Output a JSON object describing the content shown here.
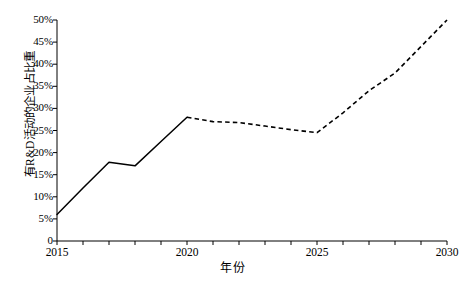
{
  "chart_data": {
    "type": "line",
    "title": "",
    "xlabel": "年份",
    "ylabel": "有R&D活动的企业占比重",
    "xlim": [
      2015,
      2030
    ],
    "ylim": [
      0,
      50
    ],
    "grid": false,
    "legend": "none",
    "x": [
      2015,
      2016,
      2017,
      2018,
      2019,
      2020,
      2021,
      2022,
      2023,
      2024,
      2025,
      2026,
      2027,
      2028,
      2029,
      2030
    ],
    "series": [
      {
        "name": "有R&D活动的企业占比重",
        "style": "solid",
        "segment": "historical",
        "x": [
          2015,
          2016,
          2017,
          2018,
          2019,
          2020
        ],
        "values": [
          6.0,
          12.0,
          17.8,
          17.0,
          22.5,
          28.0
        ]
      },
      {
        "name": "有R&D活动的企业占比重(预测)",
        "style": "dashed",
        "segment": "forecast",
        "x": [
          2020,
          2021,
          2022,
          2023,
          2024,
          2025,
          2026,
          2027,
          2028,
          2029,
          2030
        ],
        "values": [
          28.0,
          27.0,
          26.8,
          26.0,
          25.2,
          24.5,
          29.0,
          34.0,
          38.0,
          44.0,
          50.0
        ]
      }
    ],
    "y_ticks": [
      0,
      5,
      10,
      15,
      20,
      25,
      30,
      35,
      40,
      45,
      50
    ],
    "y_tick_labels": [
      "0",
      "5%",
      "10%",
      "15%",
      "20%",
      "25%",
      "30%",
      "35%",
      "40%",
      "45%",
      "50%"
    ],
    "x_ticks": [
      2015,
      2016,
      2017,
      2018,
      2019,
      2020,
      2021,
      2022,
      2023,
      2024,
      2025,
      2026,
      2027,
      2028,
      2029,
      2030
    ],
    "x_tick_labels_shown": [
      {
        "value": 2015,
        "label": "2015"
      },
      {
        "value": 2020,
        "label": "2020"
      },
      {
        "value": 2025,
        "label": "2025"
      },
      {
        "value": 2030,
        "label": "2030"
      }
    ],
    "line_color": "#000000",
    "axis_color": "#000000",
    "background_color": "#ffffff"
  },
  "figure": {
    "caption": ""
  }
}
